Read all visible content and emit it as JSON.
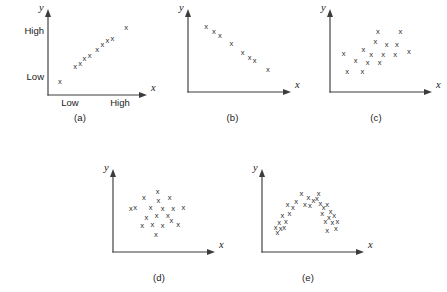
{
  "figure": {
    "background_color": "#ffffff",
    "axis_color": "#3c3c3c",
    "marker_color": "#2e2e2e",
    "marker_glyph": "x",
    "width": 447,
    "height": 292
  },
  "panels": [
    {
      "id": "a",
      "caption": "(a)",
      "pattern": "strong positive linear",
      "x_axis_title": "x",
      "y_axis_title": "y",
      "y_tick_labels": [
        "High",
        "Low"
      ],
      "x_tick_labels": [
        "Low",
        "High"
      ],
      "show_ticks": true
    },
    {
      "id": "b",
      "caption": "(b)",
      "pattern": "strong negative linear",
      "x_axis_title": "x",
      "y_axis_title": "y",
      "y_tick_labels": [],
      "x_tick_labels": [],
      "show_ticks": false
    },
    {
      "id": "c",
      "caption": "(c)",
      "pattern": "moderate positive scatter",
      "x_axis_title": "x",
      "y_axis_title": "y",
      "y_tick_labels": [],
      "x_tick_labels": [],
      "show_ticks": false
    },
    {
      "id": "d",
      "caption": "(d)",
      "pattern": "no correlation / random cloud",
      "x_axis_title": "x",
      "y_axis_title": "y",
      "y_tick_labels": [],
      "x_tick_labels": [],
      "show_ticks": false
    },
    {
      "id": "e",
      "caption": "(e)",
      "pattern": "curvilinear inverted-U",
      "x_axis_title": "x",
      "y_axis_title": "y",
      "y_tick_labels": [],
      "x_tick_labels": [],
      "show_ticks": false
    }
  ],
  "chart_data": [
    {
      "type": "scatter",
      "id": "a",
      "title": "(a)",
      "xlabel": "x",
      "ylabel": "y",
      "xlim": [
        0,
        100
      ],
      "ylim": [
        0,
        100
      ],
      "grid": false,
      "legend": "none",
      "xtick_labels": [
        "Low",
        "High"
      ],
      "xtick_values": [
        27,
        72
      ],
      "ytick_labels": [
        "Low",
        "High"
      ],
      "ytick_values": [
        16,
        78
      ],
      "points": [
        [
          8,
          14
        ],
        [
          26,
          34
        ],
        [
          32,
          38
        ],
        [
          37,
          45
        ],
        [
          43,
          48
        ],
        [
          52,
          57
        ],
        [
          58,
          64
        ],
        [
          64,
          69
        ],
        [
          70,
          72
        ],
        [
          86,
          86
        ]
      ]
    },
    {
      "type": "scatter",
      "id": "b",
      "title": "(b)",
      "xlabel": "x",
      "ylabel": "y",
      "xlim": [
        0,
        100
      ],
      "ylim": [
        0,
        100
      ],
      "grid": false,
      "legend": "none",
      "points": [
        [
          15,
          88
        ],
        [
          24,
          80
        ],
        [
          31,
          75
        ],
        [
          44,
          63
        ],
        [
          57,
          51
        ],
        [
          65,
          44
        ],
        [
          71,
          40
        ],
        [
          86,
          27
        ]
      ]
    },
    {
      "type": "scatter",
      "id": "c",
      "title": "(c)",
      "xlabel": "x",
      "ylabel": "y",
      "xlim": [
        0,
        100
      ],
      "ylim": [
        0,
        100
      ],
      "grid": false,
      "legend": "none",
      "points": [
        [
          14,
          24
        ],
        [
          32,
          24
        ],
        [
          10,
          50
        ],
        [
          24,
          40
        ],
        [
          38,
          36
        ],
        [
          52,
          36
        ],
        [
          33,
          55
        ],
        [
          42,
          48
        ],
        [
          56,
          48
        ],
        [
          70,
          48
        ],
        [
          47,
          66
        ],
        [
          60,
          62
        ],
        [
          72,
          62
        ],
        [
          86,
          52
        ],
        [
          50,
          80
        ],
        [
          76,
          80
        ]
      ]
    },
    {
      "type": "scatter",
      "id": "d",
      "title": "(d)",
      "xlabel": "x",
      "ylabel": "y",
      "xlim": [
        0,
        100
      ],
      "ylim": [
        0,
        100
      ],
      "grid": false,
      "legend": "none",
      "points": [
        [
          30,
          72
        ],
        [
          46,
          80
        ],
        [
          47,
          68
        ],
        [
          60,
          72
        ],
        [
          20,
          58
        ],
        [
          38,
          58
        ],
        [
          52,
          56
        ],
        [
          64,
          56
        ],
        [
          76,
          58
        ],
        [
          33,
          44
        ],
        [
          45,
          46
        ],
        [
          28,
          32
        ],
        [
          40,
          34
        ],
        [
          52,
          32
        ],
        [
          62,
          40
        ],
        [
          70,
          34
        ],
        [
          44,
          20
        ],
        [
          15,
          56
        ],
        [
          58,
          46
        ]
      ]
    },
    {
      "type": "scatter",
      "id": "e",
      "title": "(e)",
      "xlabel": "x",
      "ylabel": "y",
      "xlim": [
        0,
        100
      ],
      "ylim": [
        0,
        100
      ],
      "grid": false,
      "legend": "none",
      "points": [
        [
          12,
          22
        ],
        [
          16,
          28
        ],
        [
          10,
          30
        ],
        [
          20,
          30
        ],
        [
          14,
          36
        ],
        [
          22,
          38
        ],
        [
          18,
          46
        ],
        [
          26,
          50
        ],
        [
          30,
          58
        ],
        [
          24,
          62
        ],
        [
          34,
          66
        ],
        [
          40,
          78
        ],
        [
          44,
          62
        ],
        [
          50,
          60
        ],
        [
          54,
          68
        ],
        [
          60,
          78
        ],
        [
          62,
          64
        ],
        [
          66,
          58
        ],
        [
          70,
          62
        ],
        [
          74,
          52
        ],
        [
          64,
          50
        ],
        [
          72,
          44
        ],
        [
          78,
          46
        ],
        [
          68,
          38
        ],
        [
          76,
          36
        ],
        [
          82,
          38
        ],
        [
          70,
          26
        ],
        [
          80,
          28
        ],
        [
          58,
          70
        ],
        [
          48,
          72
        ]
      ]
    }
  ]
}
